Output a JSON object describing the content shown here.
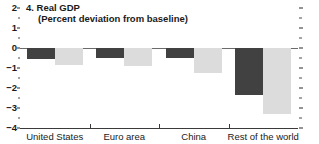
{
  "panel": {
    "number": "4.",
    "title": "4. Real GDP",
    "subtitle": "(Percent deviation from baseline)"
  },
  "chart_data": {
    "type": "bar",
    "title": "4. Real GDP",
    "subtitle": "(Percent deviation from baseline)",
    "xlabel": "",
    "ylabel": "",
    "ylim": [
      -4,
      2
    ],
    "yticks": [
      2,
      1,
      0,
      -1,
      -2,
      -3,
      -4
    ],
    "ytick_labels": [
      "2",
      "1",
      "0",
      "-1",
      "-2",
      "-3",
      "-4"
    ],
    "yminor_ticks": [
      1.5,
      0.5,
      -0.5,
      -1.5,
      -2.5,
      -3.5
    ],
    "grid": false,
    "legend": "none",
    "zero_line": true,
    "categories": [
      "United States",
      "Euro area",
      "China",
      "Rest of the world"
    ],
    "series": [
      {
        "name": "dark",
        "color": "#414141",
        "values": [
          -0.55,
          -0.5,
          -0.5,
          -2.35
        ]
      },
      {
        "name": "light",
        "color": "#dcdcdc",
        "values": [
          -0.85,
          -0.9,
          -1.25,
          -3.3
        ]
      }
    ]
  },
  "colors": {
    "bar_dark": "#414141",
    "bar_light": "#dcdcdc",
    "axis": "#3a3a3a",
    "zero_line": "#6b6b6b",
    "text": "#1a1a1a",
    "background": "#ffffff"
  }
}
